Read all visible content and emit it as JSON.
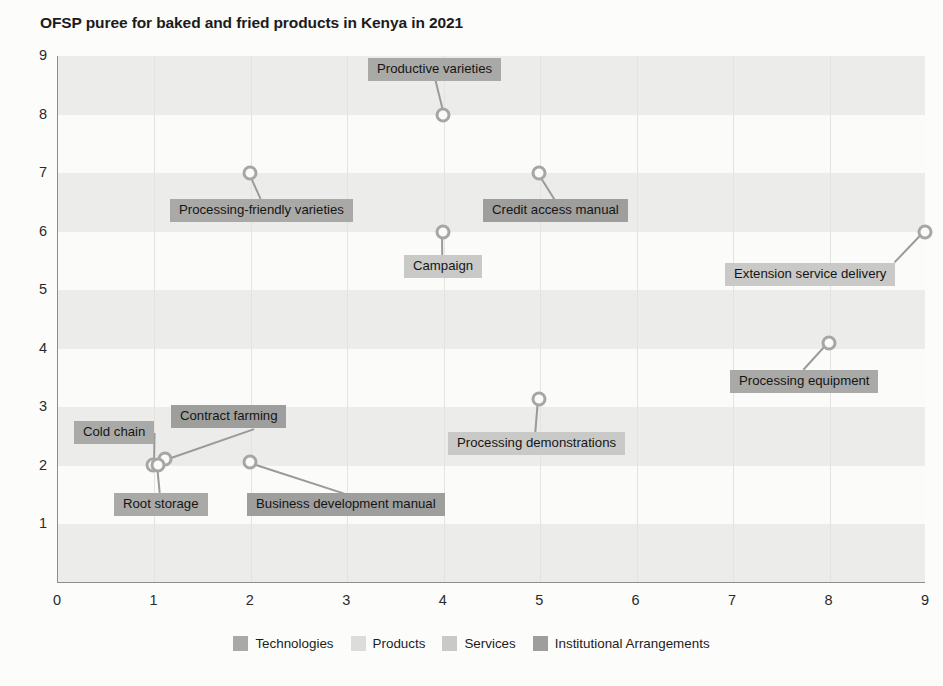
{
  "chart_data": {
    "type": "scatter",
    "title": "OFSP puree for baked and fried products in Kenya in 2021",
    "xlabel": "",
    "ylabel": "",
    "xlim": [
      0,
      9
    ],
    "ylim": [
      0,
      9
    ],
    "xticks": [
      "0",
      "1",
      "2",
      "3",
      "4",
      "5",
      "6",
      "7",
      "8",
      "9"
    ],
    "yticks": [
      "1",
      "2",
      "3",
      "4",
      "5",
      "6",
      "7",
      "8",
      "9"
    ],
    "grid": "horizontal-bands-and-vertical-lines",
    "legend_position": "bottom-center",
    "points": [
      {
        "label": "Productive varieties",
        "x": 4,
        "y": 8,
        "category": "Technologies",
        "label_pos": "above"
      },
      {
        "label": "Processing-friendly varieties",
        "x": 2,
        "y": 7,
        "category": "Technologies",
        "label_pos": "below"
      },
      {
        "label": "Credit access manual",
        "x": 5,
        "y": 7,
        "category": "Institutional Arrangements",
        "label_pos": "below"
      },
      {
        "label": "Campaign",
        "x": 4,
        "y": 6,
        "category": "Services",
        "label_pos": "below"
      },
      {
        "label": "Extension service delivery",
        "x": 9,
        "y": 6,
        "category": "Services",
        "label_pos": "below-left"
      },
      {
        "label": "Processing equipment",
        "x": 8,
        "y": 4.1,
        "category": "Technologies",
        "label_pos": "below"
      },
      {
        "label": "Processing demonstrations",
        "x": 5,
        "y": 3.15,
        "category": "Services",
        "label_pos": "below"
      },
      {
        "label": "Contract farming",
        "x": 1.12,
        "y": 2.12,
        "category": "Institutional Arrangements",
        "label_pos": "above-right"
      },
      {
        "label": "Cold chain",
        "x": 1.0,
        "y": 2.02,
        "category": "Technologies",
        "label_pos": "left"
      },
      {
        "label": "Root storage",
        "x": 1.05,
        "y": 2.02,
        "category": "Technologies",
        "label_pos": "below"
      },
      {
        "label": "Business development manual",
        "x": 2,
        "y": 2.07,
        "category": "Institutional Arrangements",
        "label_pos": "below"
      }
    ]
  },
  "legend": {
    "items": [
      {
        "label": "Technologies",
        "color": "#a9a9a7"
      },
      {
        "label": "Products",
        "color": "#dcdcda"
      },
      {
        "label": "Services",
        "color": "#c9c9c7"
      },
      {
        "label": "Institutional Arrangements",
        "color": "#9e9e9c"
      }
    ]
  },
  "colors": {
    "band": "#ececeb",
    "axis": "#8d8d8d",
    "marker_ring": "#a6a6a4",
    "leader": "#9a9a98",
    "text": "#1b1b1b",
    "background": "#fcfcfb"
  }
}
